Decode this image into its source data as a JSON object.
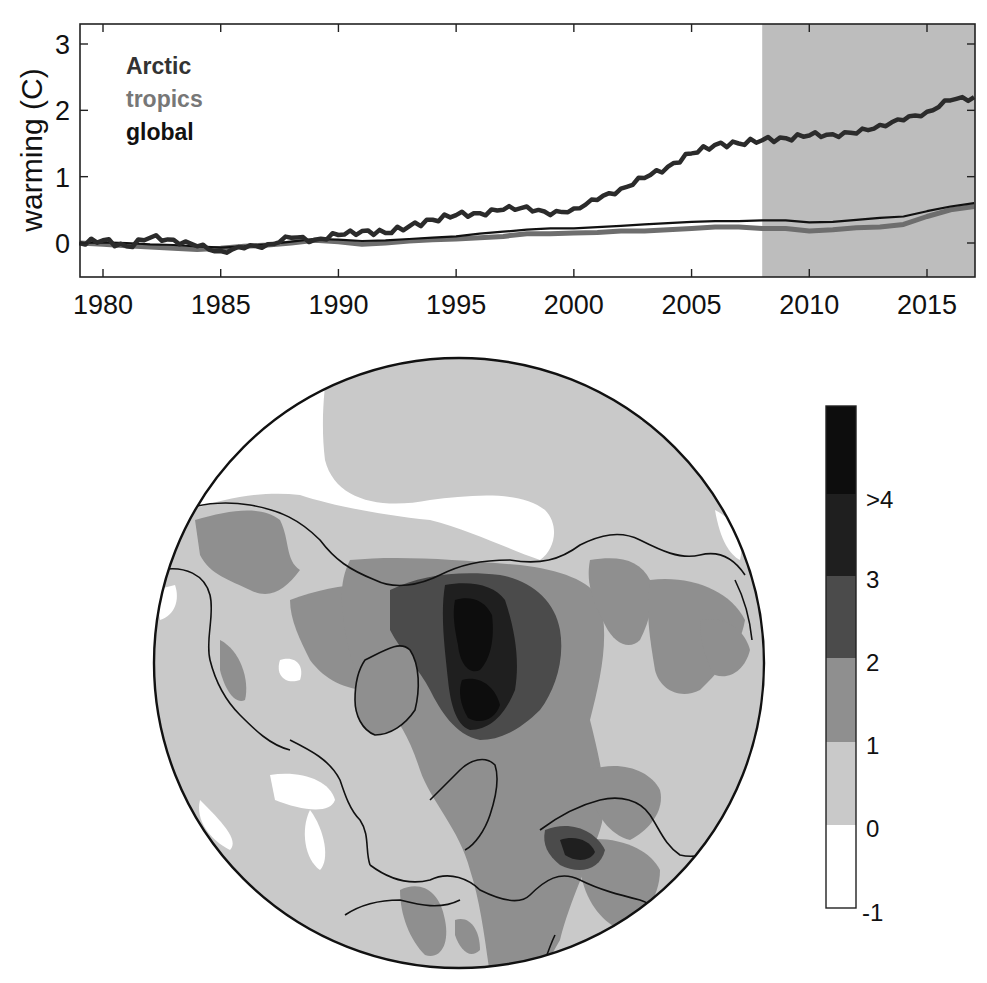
{
  "chart_data": [
    {
      "type": "line",
      "title": "",
      "xlabel": "",
      "ylabel": "warming (C)",
      "xlim": [
        1979,
        2017
      ],
      "ylim": [
        -0.45,
        3.3
      ],
      "x_ticks": [
        1980,
        1985,
        1990,
        1995,
        2000,
        2005,
        2010,
        2015
      ],
      "y_ticks": [
        0,
        1,
        2,
        3
      ],
      "grid": false,
      "legend_position": "upper-left",
      "shaded_region": {
        "x_start": 2008,
        "x_end": 2017,
        "color": "#bdbdbd"
      },
      "x": [
        1979,
        1980,
        1981,
        1982,
        1983,
        1984,
        1985,
        1986,
        1987,
        1988,
        1989,
        1990,
        1991,
        1992,
        1993,
        1994,
        1995,
        1996,
        1997,
        1998,
        1999,
        2000,
        2001,
        2002,
        2003,
        2004,
        2005,
        2006,
        2007,
        2008,
        2009,
        2010,
        2011,
        2012,
        2013,
        2014,
        2015,
        2016,
        2017
      ],
      "series": [
        {
          "name": "Arctic",
          "color": "#333333",
          "values": [
            0.0,
            0.04,
            -0.05,
            0.08,
            0.05,
            -0.05,
            -0.12,
            -0.08,
            -0.02,
            0.08,
            0.05,
            0.12,
            0.18,
            0.15,
            0.25,
            0.35,
            0.42,
            0.45,
            0.5,
            0.55,
            0.42,
            0.52,
            0.65,
            0.82,
            0.98,
            1.15,
            1.35,
            1.48,
            1.5,
            1.55,
            1.58,
            1.62,
            1.64,
            1.65,
            1.78,
            1.85,
            1.98,
            2.15,
            2.2
          ]
        },
        {
          "name": "tropics",
          "color": "#6e6e6e",
          "values": [
            0.0,
            -0.02,
            -0.04,
            -0.06,
            -0.08,
            -0.1,
            -0.08,
            -0.05,
            -0.03,
            0.0,
            0.04,
            0.02,
            -0.02,
            0.0,
            0.03,
            0.05,
            0.06,
            0.08,
            0.1,
            0.14,
            0.14,
            0.15,
            0.16,
            0.18,
            0.18,
            0.2,
            0.22,
            0.24,
            0.24,
            0.22,
            0.22,
            0.18,
            0.2,
            0.23,
            0.24,
            0.28,
            0.4,
            0.5,
            0.55
          ]
        },
        {
          "name": "global",
          "color": "#111111",
          "values": [
            0.0,
            0.01,
            0.0,
            -0.02,
            -0.03,
            -0.05,
            -0.07,
            -0.05,
            -0.02,
            0.02,
            0.06,
            0.05,
            0.03,
            0.04,
            0.06,
            0.08,
            0.1,
            0.14,
            0.17,
            0.2,
            0.22,
            0.22,
            0.24,
            0.26,
            0.28,
            0.3,
            0.32,
            0.33,
            0.33,
            0.34,
            0.34,
            0.31,
            0.32,
            0.35,
            0.38,
            0.4,
            0.48,
            0.55,
            0.6
          ]
        }
      ]
    },
    {
      "type": "heatmap",
      "title": "",
      "projection": "north-polar stereographic",
      "colorbar": {
        "labels": [
          "-1",
          "0",
          "1",
          "2",
          "3",
          ">4"
        ],
        "levels": [
          -1,
          0,
          1,
          2,
          3,
          4
        ],
        "band_colors": [
          "#ffffff",
          "#c9c9c9",
          "#8f8f8f",
          "#4b4b4b",
          "#1f1f1f",
          "#0d0d0d"
        ]
      },
      "annotations": "Strongest warming (>3 to >4 C) over central Arctic Ocean / Barents–Kara region; moderate (1–3 C) over Greenland, Canadian Arctic Archipelago, Siberia and Caspian region; near 0 or slightly negative over North Pacific patches and North Atlantic spots."
    }
  ],
  "top_panel": {
    "ylabel": "warming (C)",
    "y_ticks": [
      "0",
      "1",
      "2",
      "3"
    ],
    "x_ticks": [
      "1980",
      "1985",
      "1990",
      "1995",
      "2000",
      "2005",
      "2010",
      "2015"
    ],
    "legend": [
      {
        "label": "Arctic",
        "color": "#333333"
      },
      {
        "label": "tropics",
        "color": "#747474"
      },
      {
        "label": "global",
        "color": "#111111"
      }
    ]
  },
  "colorbar": {
    "labels": [
      ">4",
      "3",
      "2",
      "1",
      "0",
      "-1"
    ]
  }
}
